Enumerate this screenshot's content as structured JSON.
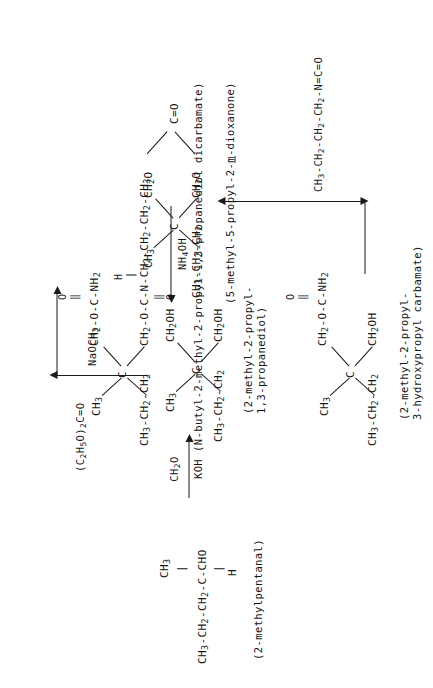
{
  "document": {
    "type": "chemical-reaction-scheme",
    "orientation": "rotated-90-ccw",
    "page_background": "#ffffff",
    "ink_color": "#161616"
  },
  "structures": {
    "s1": {
      "id": "2-methylpentanal",
      "backbone": "CH3 -CH2 -CH2 -C-CHO",
      "backbone_parts": [
        "CH",
        "3",
        " -CH",
        "2",
        " -CH",
        "2",
        " -C-CHO"
      ],
      "substituent_top": "CH3",
      "substituent_bottom": "H",
      "bond_top": "|",
      "bond_bottom": "|",
      "name": "(2-methylpentanal)"
    },
    "s2": {
      "id": "2-methyl-2-propyl-1,3-propanediol",
      "center": "C",
      "arm_upper_left": "CH3",
      "arm_upper_right": "CH2OH",
      "arm_lower_left": "CH3 -CH2 -CH2",
      "arm_lower_right": "CH2OH",
      "name_line1": "(2-methyl-2-propyl-",
      "name_line2": "1,3-propanediol)"
    },
    "s3": {
      "id": "5-methyl-5-propyl-2-m-dioxanone",
      "center": "C",
      "arm_upper_left": "CH3",
      "arm_lower_left": "CH3 -CH2 -CH2",
      "ring_upper": "CH2O",
      "ring_lower": "CH2O",
      "ring_apex": "C=O",
      "name_prefix": "(5-methyl-5-propyl-2-",
      "name_italic": "m",
      "name_suffix": "-dioxanone)"
    },
    "s4": {
      "id": "2-methyl-2-propyl-3-hydroxypropyl-carbamate",
      "center": "C",
      "arm_upper_left": "CH3",
      "arm_lower_left": "CH3 -CH2 -CH2",
      "arm_upper_right": "CH2 -O-C-NH2",
      "arm_upper_right_o": "O",
      "arm_upper_right_dbl": "‖",
      "arm_lower_right": "CH2OH",
      "name_line1": "(2-methyl-2-propyl-",
      "name_line2": "3-hydroxypropyl carbamate)"
    },
    "s5": {
      "id": "N-butyl-2-methyl-2-propyl-1,3-propanediol-dicarbamate",
      "center": "C",
      "arm_upper_left": "CH3",
      "arm_lower_left": "CH3 -CH2 -CH2",
      "arm_upper_right": "CH2 -O-C-NH2",
      "arm_upper_right_o": "O",
      "arm_upper_right_dbl": "‖",
      "arm_lower_right": "CH2 -O-C-N-CH2 -CH2 -CH2 -CH3",
      "arm_lower_right_h": "H",
      "arm_lower_right_hbond": "|",
      "arm_lower_right_o": "O",
      "arm_lower_right_dbl": "‖",
      "name": "(N-butyl-2-methyl-2-propyl-1,3-propanediol dicarbamate)"
    }
  },
  "reactions": {
    "r1": {
      "label": "step-1-aldol-formaldehyde",
      "reagent_above": "CH2O",
      "reagent_below": "KOH",
      "direction": "right"
    },
    "r2": {
      "label": "step-2-diethyl-carbonate",
      "reagent_above": "(C2H5O)2C=O",
      "reagent_below": "NaOCH3",
      "direction": "right-up"
    },
    "r3": {
      "label": "step-3-ammonolysis",
      "reagent": "NH4OH",
      "direction": "down"
    },
    "r4": {
      "label": "step-4-butyl-isocyanate",
      "reagent": "CH3 -CH2 -CH2 -CH2 -N=C=O",
      "direction": "right-up"
    }
  }
}
